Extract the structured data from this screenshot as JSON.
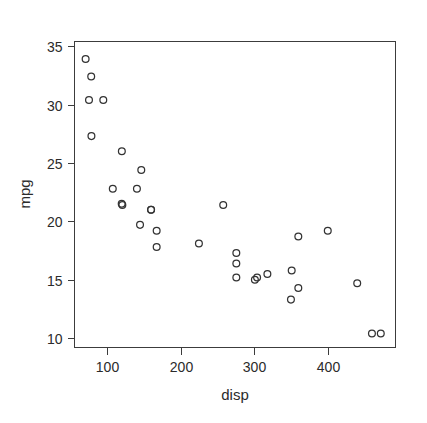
{
  "chart_data": {
    "type": "scatter",
    "title": "",
    "xlabel": "disp",
    "ylabel": "mpg",
    "xlim": [
      56,
      492
    ],
    "ylim": [
      9.2,
      35.4
    ],
    "grid": false,
    "legend": null,
    "marker": "open-circle",
    "marker_color": "#333333",
    "background": "#ffffff",
    "xticks": [
      100,
      200,
      300,
      400
    ],
    "xtick_labels": [
      "100",
      "200",
      "300",
      "400"
    ],
    "yticks": [
      10,
      15,
      20,
      25,
      30,
      35
    ],
    "ytick_labels": [
      "10",
      "15",
      "20",
      "25",
      "30",
      "35"
    ],
    "x": [
      160,
      160,
      108,
      258,
      360,
      225,
      360,
      146.7,
      140.8,
      167.6,
      167.6,
      275.8,
      275.8,
      275.8,
      472,
      460,
      440,
      78.7,
      75.7,
      71.1,
      120.1,
      318,
      304,
      350,
      400,
      79,
      120.3,
      95.1,
      351,
      145,
      301,
      121
    ],
    "y": [
      21.0,
      21.0,
      22.8,
      21.4,
      18.7,
      18.1,
      14.3,
      24.4,
      22.8,
      19.2,
      17.8,
      16.4,
      17.3,
      15.2,
      10.4,
      10.4,
      14.7,
      32.4,
      30.4,
      33.9,
      21.5,
      15.5,
      15.2,
      13.3,
      19.2,
      27.3,
      26.0,
      30.4,
      15.8,
      19.7,
      15.0,
      21.4
    ],
    "n_points": 32
  },
  "axis_labels": {
    "x_title": "disp",
    "y_title": "mpg"
  }
}
